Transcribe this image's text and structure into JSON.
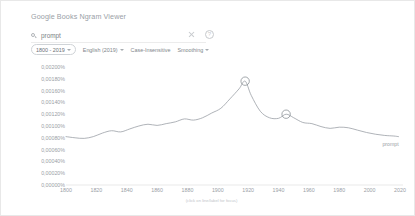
{
  "header": {
    "title": "Google Books Ngram Viewer"
  },
  "search": {
    "icon": "search-icon",
    "value": "prompt",
    "placeholder": "prompt"
  },
  "header_icons": [
    {
      "name": "close-icon",
      "glyph": ""
    },
    {
      "name": "help-icon",
      "glyph": "?"
    }
  ],
  "chips": [
    {
      "name": "year-range-chip",
      "label": "1800 - 2019",
      "boxed": true,
      "caret": true
    },
    {
      "name": "corpus-chip",
      "label": "English (2019)",
      "boxed": false,
      "caret": true
    },
    {
      "name": "case-insensitive-chip",
      "label": "Case-Insensitive",
      "boxed": false,
      "caret": false
    },
    {
      "name": "smoothing-chip",
      "label": "Smoothing",
      "boxed": false,
      "caret": true
    }
  ],
  "footnote": "(click on line/label for focus)",
  "chart_data": {
    "type": "line",
    "title": "",
    "xlabel": "",
    "ylabel": "",
    "xlim": [
      1800,
      2022
    ],
    "ylim": [
      0,
      0.002
    ],
    "grid": false,
    "legend_position": "line-end-right",
    "ytick_labels": [
      "0,00200%",
      "0,00180%",
      "0,00160%",
      "0,00140%",
      "0,00120%",
      "0,00100%",
      "0,00080%",
      "0,00060%",
      "0,00040%",
      "0,00020%",
      "0,00000%"
    ],
    "yticks": [
      0.002,
      0.0018,
      0.0016,
      0.0014,
      0.0012,
      0.001,
      0.0008,
      0.0006,
      0.0004,
      0.0002,
      0.0
    ],
    "xtick_labels": [
      "1800",
      "1820",
      "1840",
      "1860",
      "1880",
      "1900",
      "1920",
      "1940",
      "1960",
      "1980",
      "2000",
      "2020"
    ],
    "xticks": [
      1800,
      1820,
      1840,
      1860,
      1880,
      1900,
      1920,
      1940,
      1960,
      1980,
      2000,
      2020
    ],
    "series": [
      {
        "name": "prompt",
        "label": "prompt",
        "color": "#9aa0a6",
        "x": [
          1800,
          1806,
          1812,
          1818,
          1824,
          1830,
          1836,
          1842,
          1848,
          1854,
          1860,
          1866,
          1872,
          1878,
          1884,
          1890,
          1896,
          1902,
          1908,
          1914,
          1918,
          1922,
          1928,
          1934,
          1940,
          1945,
          1950,
          1956,
          1962,
          1968,
          1974,
          1980,
          1986,
          1992,
          1998,
          2004,
          2010,
          2016,
          2019
        ],
        "values": [
          0.00082,
          0.0008,
          0.00079,
          0.00082,
          0.00088,
          0.00092,
          0.0009,
          0.00095,
          0.001,
          0.00103,
          0.00101,
          0.00104,
          0.00107,
          0.00112,
          0.0011,
          0.00114,
          0.00122,
          0.0013,
          0.00146,
          0.00163,
          0.00176,
          0.00152,
          0.00125,
          0.00114,
          0.00113,
          0.0012,
          0.00114,
          0.00106,
          0.00104,
          0.00099,
          0.00096,
          0.00098,
          0.00097,
          0.00093,
          0.00089,
          0.00086,
          0.00084,
          0.00083,
          0.00082
        ]
      }
    ],
    "annotations": [
      {
        "name": "peak-marker",
        "x": 1918,
        "y": 0.00176,
        "shape": "circle"
      },
      {
        "name": "secondary-marker",
        "x": 1945,
        "y": 0.0012,
        "shape": "circle"
      }
    ]
  }
}
